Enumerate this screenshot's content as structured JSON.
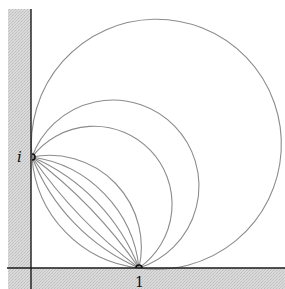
{
  "diagram": {
    "type": "pencil-of-circles",
    "colors": {
      "background": "#ffffff",
      "shading": "#d4d4d4",
      "axis": "#1a1a1a",
      "arc": "#8c8c8c"
    },
    "points": [
      {
        "name": "i",
        "label": "i",
        "x": 32,
        "y": 157
      },
      {
        "name": "one",
        "label": "1",
        "x": 139,
        "y": 268
      }
    ],
    "arcs": [
      {
        "radius": 125,
        "large": 1,
        "sweep": 1
      },
      {
        "radius": 86,
        "large": 1,
        "sweep": 1
      },
      {
        "radius": 78,
        "large": 1,
        "sweep": 1
      },
      {
        "radius": 92,
        "large": 0,
        "sweep": 1
      },
      {
        "radius": 125,
        "large": 0,
        "sweep": 1
      },
      {
        "radius": 200,
        "large": 0,
        "sweep": 1
      },
      {
        "radius": 480,
        "large": 0,
        "sweep": 1
      },
      {
        "radius": 480,
        "large": 0,
        "sweep": 0
      },
      {
        "radius": 200,
        "large": 0,
        "sweep": 0
      },
      {
        "radius": 120,
        "large": 0,
        "sweep": 0
      }
    ],
    "labels": {
      "i": "i",
      "one": "1"
    }
  }
}
